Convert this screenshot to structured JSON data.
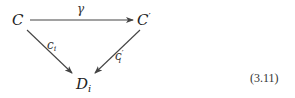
{
  "diagram": {
    "type": "commutative-triangle",
    "nodes": {
      "top_left": {
        "base": "C",
        "prime": "",
        "sub": ""
      },
      "top_right": {
        "base": "C",
        "prime": "′",
        "sub": ""
      },
      "bottom": {
        "base": "D",
        "prime": "",
        "sub": "i"
      }
    },
    "edges": [
      {
        "from": "top_left",
        "to": "top_right",
        "label_base": "γ",
        "label_prime": "",
        "label_sub": ""
      },
      {
        "from": "top_left",
        "to": "bottom",
        "label_base": "c",
        "label_prime": "",
        "label_sub": "i"
      },
      {
        "from": "top_right",
        "to": "bottom",
        "label_base": "c",
        "label_prime": "′",
        "label_sub": "i"
      }
    ],
    "equation_number": "(3.11)"
  }
}
